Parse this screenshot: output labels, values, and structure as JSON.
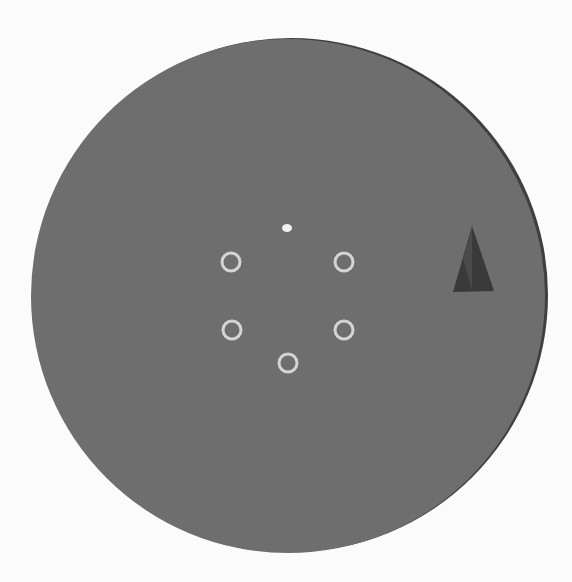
{
  "scene": {
    "title": "Visual stimulus display",
    "background_color": "#fbfbfb",
    "canvas": {
      "width": 572,
      "height": 582
    }
  },
  "disc": {
    "label": "Gray circular field",
    "cx": 288,
    "cy": 296,
    "r": 257,
    "fill": "#6e6e6e",
    "rim_shadow_color": "#3f3f3f"
  },
  "fixation": {
    "label": "Fixation point",
    "cx": 287,
    "cy": 228,
    "rx": 5,
    "ry": 4,
    "fill": "#f2f2f2"
  },
  "rings": {
    "label": "Placeholder rings",
    "stroke": "#d4d4d4",
    "stroke_width": 3,
    "r": 9,
    "items": [
      {
        "id": "ring-upper-left",
        "cx": 231,
        "cy": 262
      },
      {
        "id": "ring-upper-right",
        "cx": 344,
        "cy": 262
      },
      {
        "id": "ring-lower-left",
        "cx": 232,
        "cy": 330
      },
      {
        "id": "ring-lower-right",
        "cx": 344,
        "cy": 330
      },
      {
        "id": "ring-bottom",
        "cx": 288,
        "cy": 363
      }
    ]
  },
  "cue": {
    "label": "Triangle cue",
    "points": "472,226 453,292 494,291",
    "fill": "#3a3a3a",
    "highlight_points": "472,226 463,258 472,291",
    "highlight_fill": "#4a4a4a"
  }
}
